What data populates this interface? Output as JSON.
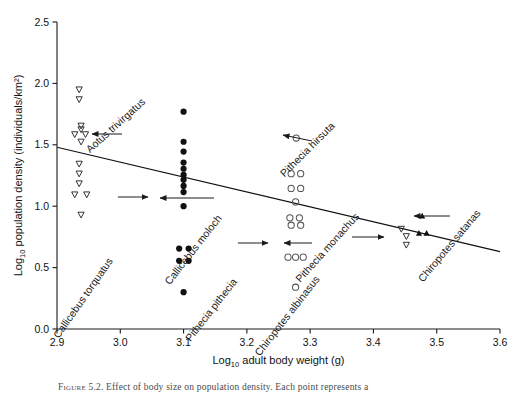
{
  "figure": {
    "caption_prefix": "Figure 5.2.",
    "caption_text": "Effect of body size on population density. Each point represents a",
    "caption_visible_note": "caption partially cropped at bottom edge"
  },
  "axes": {
    "x_label_main": "adult body weight (g)",
    "x_label_prefix": "Log",
    "x_label_sub": "10",
    "y_label_main": "population density (individuals/km²)",
    "y_label_prefix": "Log",
    "y_label_sub": "10",
    "x_ticks": [
      "2.9",
      "3.0",
      "3.1",
      "3.2",
      "3.3",
      "3.4",
      "3.5",
      "3.6"
    ],
    "y_ticks": [
      "0.0",
      "0.5",
      "1.0",
      "1.5",
      "2.0",
      "2.5"
    ],
    "axis_color": "#1a1a1a"
  },
  "annotations": [
    {
      "id": "aotus-trivirgatus",
      "label": "Aotus trivirgatus",
      "marker": "open-down-triangle",
      "label_x": 118,
      "label_y": 128,
      "rotation": -42,
      "arrow": {
        "x1": 122,
        "y1": 134,
        "x2": 92,
        "y2": 134
      }
    },
    {
      "id": "callicebus-torquatus",
      "label": "Callicebus torquatus",
      "marker": "open-down-triangle",
      "label_x": 86,
      "label_y": 300,
      "rotation": -55,
      "arrow": {
        "x1": 118,
        "y1": 197,
        "x2": 148,
        "y2": 197
      }
    },
    {
      "id": "callicebus-moloch",
      "label": "Callicebus moloch",
      "marker": "filled-circle",
      "label_x": 196,
      "label_y": 252,
      "rotation": -52,
      "arrow": {
        "x1": 214,
        "y1": 198,
        "x2": 160,
        "y2": 198
      }
    },
    {
      "id": "pithecia-hirsuta",
      "label": "Pithecia hirsuta",
      "marker": "open-circle",
      "label_x": 310,
      "label_y": 152,
      "rotation": -45,
      "arrow": {
        "x1": 312,
        "y1": 141,
        "x2": 283,
        "y2": 135
      }
    },
    {
      "id": "pithecia-pithecia",
      "label": "Pithecia pithecia",
      "marker": "open-circle",
      "label_x": 214,
      "label_y": 312,
      "rotation": -52,
      "arrow": {
        "x1": 238,
        "y1": 243,
        "x2": 268,
        "y2": 243
      }
    },
    {
      "id": "pithecia-monachus",
      "label": "Pithecia monachus",
      "marker": "open-circle",
      "label_x": 330,
      "label_y": 250,
      "rotation": -48,
      "arrow": {
        "x1": 312,
        "y1": 243,
        "x2": 284,
        "y2": 243
      }
    },
    {
      "id": "chiropotes-albinasus",
      "label": "Chiropotes albinasus",
      "marker": "open-down-triangle",
      "label_x": 290,
      "label_y": 318,
      "rotation": -52,
      "arrow": {
        "x1": 352,
        "y1": 237,
        "x2": 384,
        "y2": 237
      }
    },
    {
      "id": "chiropotes-satanas",
      "label": "Chiropotes satanas",
      "marker": "filled-triangle",
      "label_x": 452,
      "label_y": 248,
      "rotation": -50,
      "arrow": {
        "x1": 450,
        "y1": 216,
        "x2": 414,
        "y2": 216
      }
    }
  ],
  "chart_data": {
    "type": "scatter",
    "title": "",
    "xlabel": "Log10 adult body weight (g)",
    "ylabel": "Log10 population density (individuals/km2)",
    "xlim": [
      2.9,
      3.6
    ],
    "ylim": [
      0.0,
      2.5
    ],
    "xticks": [
      2.9,
      3.0,
      3.1,
      3.2,
      3.3,
      3.4,
      3.5,
      3.6
    ],
    "yticks": [
      0.0,
      0.5,
      1.0,
      1.5,
      2.0,
      2.5
    ],
    "grid": false,
    "legend": "none (points labelled in-plot with arrows)",
    "trendline": {
      "label": "regression line",
      "x": [
        2.9,
        3.6
      ],
      "y": [
        1.48,
        0.63
      ],
      "slope": -1.21,
      "intercept": 5.0
    },
    "series": [
      {
        "name": "Aotus trivirgatus",
        "marker": "open-down-triangle",
        "color": "#333333",
        "points": [
          [
            2.935,
            1.95
          ],
          [
            2.935,
            1.87
          ],
          [
            2.938,
            1.655
          ],
          [
            2.938,
            1.625
          ],
          [
            2.928,
            1.585
          ],
          [
            2.945,
            1.585
          ],
          [
            2.938,
            1.525
          ],
          [
            2.935,
            1.345
          ],
          [
            2.935,
            1.265
          ],
          [
            2.935,
            1.185
          ],
          [
            2.928,
            1.095
          ],
          [
            2.947,
            1.095
          ],
          [
            2.938,
            0.93
          ]
        ]
      },
      {
        "name": "Callicebus moloch",
        "marker": "filled-circle",
        "color": "#111111",
        "points": [
          [
            3.1,
            1.77
          ],
          [
            3.1,
            1.525
          ],
          [
            3.1,
            1.445
          ],
          [
            3.1,
            1.355
          ],
          [
            3.1,
            1.305
          ],
          [
            3.1,
            1.255
          ],
          [
            3.1,
            1.215
          ],
          [
            3.1,
            1.165
          ],
          [
            3.1,
            1.115
          ],
          [
            3.1,
            1.0
          ],
          [
            3.093,
            0.655
          ],
          [
            3.108,
            0.655
          ],
          [
            3.093,
            0.555
          ],
          [
            3.108,
            0.555
          ],
          [
            3.1,
            0.3
          ]
        ]
      },
      {
        "name": "Pithecia hirsuta",
        "marker": "open-circle",
        "color": "#555555",
        "points": [
          [
            3.278,
            1.555
          ]
        ]
      },
      {
        "name": "Pithecia pithecia / Pithecia monachus",
        "marker": "open-circle",
        "color": "#555555",
        "points": [
          [
            3.27,
            1.265
          ],
          [
            3.285,
            1.265
          ],
          [
            3.27,
            1.145
          ],
          [
            3.285,
            1.145
          ],
          [
            3.277,
            1.035
          ],
          [
            3.268,
            0.905
          ],
          [
            3.283,
            0.905
          ],
          [
            3.27,
            0.845
          ],
          [
            3.285,
            0.845
          ],
          [
            3.265,
            0.585
          ],
          [
            3.277,
            0.585
          ],
          [
            3.289,
            0.585
          ],
          [
            3.277,
            0.34
          ]
        ]
      },
      {
        "name": "Chiropotes albinasus",
        "marker": "open-down-triangle",
        "color": "#333333",
        "points": [
          [
            3.444,
            0.815
          ],
          [
            3.452,
            0.755
          ],
          [
            3.452,
            0.685
          ]
        ]
      },
      {
        "name": "Chiropotes satanas",
        "marker": "filled-triangle",
        "color": "#111111",
        "points": [
          [
            3.477,
            0.92
          ],
          [
            3.472,
            0.78
          ],
          [
            3.484,
            0.78
          ]
        ]
      }
    ]
  }
}
